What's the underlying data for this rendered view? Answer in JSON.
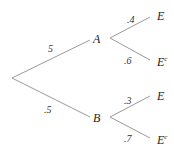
{
  "diagram": {
    "type": "probability-tree",
    "root": "",
    "level1": [
      {
        "node": "A",
        "prob": "5"
      },
      {
        "node": "B",
        "prob": ".5"
      }
    ],
    "level2": {
      "A": [
        {
          "node": "E",
          "sup": "",
          "prob": ".4"
        },
        {
          "node": "E",
          "sup": "c",
          "prob": ".6"
        }
      ],
      "B": [
        {
          "node": "E",
          "sup": "",
          "prob": ".3"
        },
        {
          "node": "E",
          "sup": "c",
          "prob": ".7"
        }
      ]
    }
  }
}
